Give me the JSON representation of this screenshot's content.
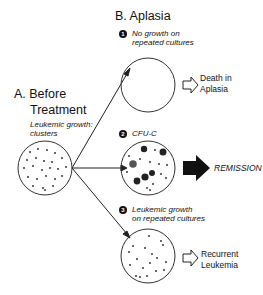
{
  "sections": {
    "before": {
      "letter_title": "A. Before",
      "title_line2": "Treatment",
      "caption_line1": "Leukemic growth:",
      "caption_line2": "clusters"
    },
    "aplasia": {
      "title": "B. Aplasia"
    }
  },
  "outcomes": [
    {
      "number": "1",
      "caption_line1": "No growth on",
      "caption_line2": "repeated cultures",
      "result_line1": "Death in",
      "result_line2": "Aplasia",
      "arrow": "hollow-arrow"
    },
    {
      "number": "2",
      "caption_line1": "CFU-C",
      "result_line1": "REMISSION",
      "arrow": "solid-arrow"
    },
    {
      "number": "3",
      "caption_line1": "Leukemic growth",
      "caption_line2": "on repeated cultures",
      "result_line1": "Recurrent",
      "result_line2": "Leukemia",
      "arrow": "hollow-arrow"
    }
  ]
}
